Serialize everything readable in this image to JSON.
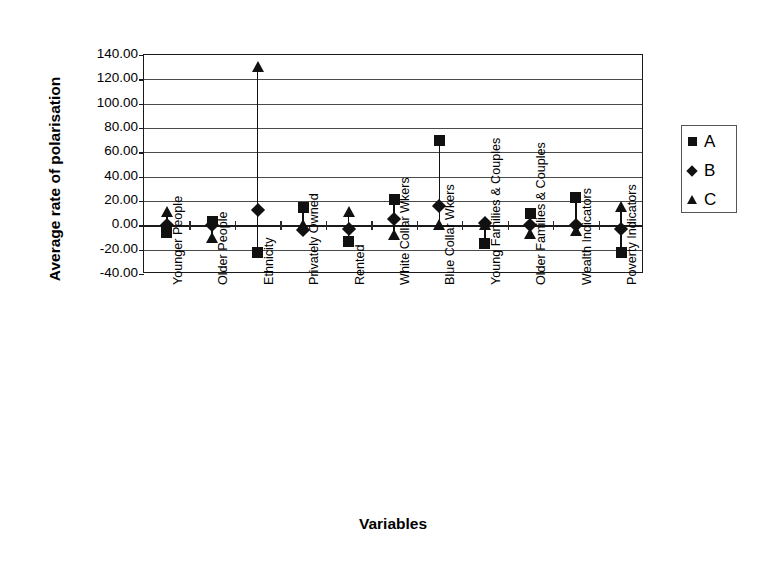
{
  "chart_data": {
    "type": "scatter",
    "title": "",
    "xlabel": "Variables",
    "ylabel": "Average rate of polarisation",
    "ylim": [
      -40,
      140
    ],
    "ytick_labels": [
      "140.00",
      "120.00",
      "100.00",
      "80.00",
      "60.00",
      "40.00",
      "20.00",
      "0.00",
      "-20.00",
      "-40.00"
    ],
    "ytick_values": [
      140,
      120,
      100,
      80,
      60,
      40,
      20,
      0,
      -20,
      -40
    ],
    "grid": true,
    "legend_position": "right",
    "categories": [
      "Younger People",
      "Older People",
      "Ethnicity",
      "Privately Owned",
      "Rented",
      "White Collar Wkers",
      "Blue Collar Wkers",
      "Young Families & Couples",
      "Older Families & Couples",
      "Wealth Indicators",
      "Poverty Indicators"
    ],
    "series": [
      {
        "name": "A",
        "marker": "square",
        "color": "#111111",
        "values": [
          -6,
          3,
          -22,
          15,
          -13,
          21,
          70,
          -15,
          10,
          23,
          -22
        ]
      },
      {
        "name": "B",
        "marker": "diamond",
        "color": "#111111",
        "values": [
          0,
          0,
          13,
          -4,
          -3,
          5,
          16,
          2,
          0,
          0,
          -3
        ]
      },
      {
        "name": "C",
        "marker": "triangle",
        "color": "#111111",
        "values": [
          11,
          -10,
          130,
          0,
          11,
          -8,
          0,
          0,
          -7,
          -5,
          15
        ]
      }
    ]
  },
  "legend": {
    "entries": [
      {
        "label": "A",
        "marker": "square"
      },
      {
        "label": "B",
        "marker": "diamond"
      },
      {
        "label": "C",
        "marker": "triangle"
      }
    ]
  }
}
